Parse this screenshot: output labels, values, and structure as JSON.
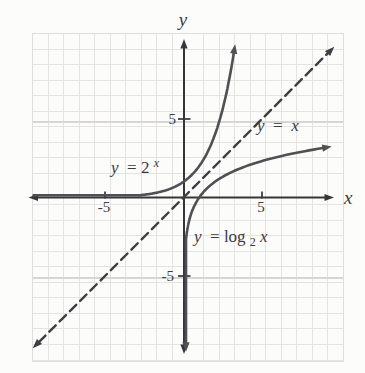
{
  "figure": {
    "background_color": "#fcfcfb",
    "text_color": "#3b3b40",
    "grid": {
      "minor_color": "#e6e4e1",
      "major_color": "#d8d6d2",
      "border_color": "#e0ded9"
    }
  },
  "axes": {
    "x_label": "x",
    "y_label": "y",
    "color": "#36363a",
    "x_ticks": [
      {
        "value": -5,
        "label": "-5"
      },
      {
        "value": 5,
        "label": "5"
      }
    ],
    "y_ticks": [
      {
        "value": 5,
        "label": "5"
      },
      {
        "value": -5,
        "label": "-5"
      }
    ]
  },
  "chart_data": {
    "type": "line",
    "title": "",
    "xlabel": "x",
    "ylabel": "y",
    "xlim": [
      -9.7,
      9.7
    ],
    "ylim": [
      -9.9,
      9.9
    ],
    "grid": true,
    "legend": "inline-annotations",
    "series": [
      {
        "name": "y = 2^x",
        "fn": "pow2",
        "style": "solid",
        "color": "#4f4f54",
        "x_range": [
          -9.55,
          3.25
        ],
        "key_points": [
          [
            -2,
            0.25
          ],
          [
            -1,
            0.5
          ],
          [
            0,
            1
          ],
          [
            1,
            2
          ],
          [
            2,
            4
          ],
          [
            3,
            8
          ]
        ],
        "asymptote": "y = 0",
        "label": {
          "var": "y",
          "rest": " = 2",
          "sup": "x"
        }
      },
      {
        "name": "y = log2(x)",
        "fn": "log2",
        "style": "solid",
        "color": "#4f4f54",
        "y_range": [
          -9.25,
          3.25
        ],
        "key_points": [
          [
            0.25,
            -2
          ],
          [
            0.5,
            -1
          ],
          [
            1,
            0
          ],
          [
            2,
            1
          ],
          [
            4,
            2
          ],
          [
            8,
            3
          ]
        ],
        "asymptote": "x = 0",
        "label": {
          "var": "y",
          "rest": " = log",
          "sub": "2",
          "arg": "x"
        }
      },
      {
        "name": "y = x",
        "fn": "identity",
        "style": "dashed",
        "color": "#3e3e43",
        "x_range": [
          -9.2,
          9.2
        ],
        "key_points": [
          [
            -5,
            -5
          ],
          [
            0,
            0
          ],
          [
            5,
            5
          ]
        ],
        "label": {
          "var": "y",
          "rest": " = ",
          "arg": "x"
        }
      }
    ]
  }
}
